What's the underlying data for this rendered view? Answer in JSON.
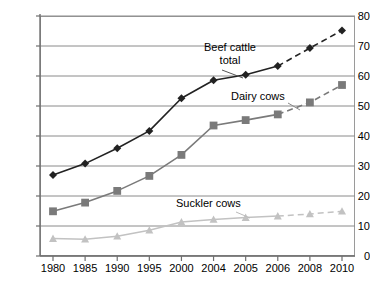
{
  "chart_data": {
    "type": "line",
    "title": "",
    "subtitle": "",
    "xlabel": "",
    "ylabel": "",
    "categories": [
      "1980",
      "1985",
      "1990",
      "1995",
      "2000",
      "2004",
      "2005",
      "2006",
      "2008",
      "2010"
    ],
    "ylim": [
      0,
      80
    ],
    "yticks": [
      0,
      10,
      20,
      30,
      40,
      50,
      60,
      70,
      80
    ],
    "ytick_labels": [
      "0",
      "10",
      "20",
      "30",
      "40",
      "50",
      "60",
      "70",
      "80"
    ],
    "grid": true,
    "grid_axis": "y",
    "legend_position": "inline-annotations",
    "forecast_from_index": 7,
    "series": [
      {
        "name": "Beef cattle total",
        "label_text": "Beef cattle\ntotal",
        "label_line1": "Beef cattle",
        "label_line2": "total",
        "color": "#222222",
        "marker": "diamond",
        "values": [
          27.0,
          30.8,
          35.9,
          41.7,
          52.6,
          58.6,
          60.4,
          63.3,
          69.3,
          75.2
        ]
      },
      {
        "name": "Dairy cows",
        "label_text": "Dairy cows",
        "color": "#7a7a7a",
        "marker": "square",
        "values": [
          14.9,
          17.8,
          21.7,
          26.7,
          33.7,
          43.5,
          45.3,
          47.2,
          51.2,
          57.0
        ]
      },
      {
        "name": "Suckler cows",
        "label_text": "Suckler cows",
        "color": "#c2c2c2",
        "marker": "triangle",
        "values": [
          5.8,
          5.6,
          6.6,
          8.6,
          11.3,
          12.2,
          12.8,
          13.3,
          14.0,
          14.9
        ]
      }
    ]
  },
  "colors": {
    "axis": "#6f6f6f",
    "grid": "#8a8a8a",
    "frame": "#9a9a9a",
    "beef": "#222222",
    "dairy": "#7a7a7a",
    "suckler": "#c2c2c2",
    "text": "#000000",
    "background": "#ffffff"
  }
}
